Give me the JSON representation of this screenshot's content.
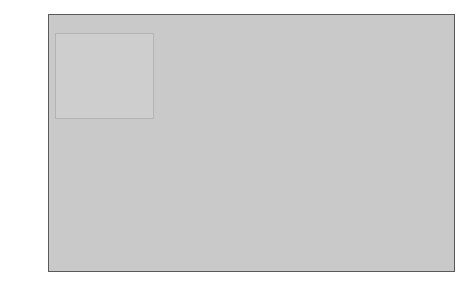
{
  "chart_data": {
    "type": "area",
    "stacked": true,
    "title": "",
    "xlabel": "",
    "ylabel": "",
    "xlim": [
      1950,
      2150
    ],
    "ylim": [
      0,
      12
    ],
    "xticks": [
      1950,
      1990,
      2000,
      2025,
      2050,
      2075,
      2100,
      2125,
      2150
    ],
    "xtick_labels": [
      "1950",
      "1990",
      "2000",
      "2025",
      "2050",
      "2075",
      "2100",
      "2125",
      "2150"
    ],
    "yticks": [
      0,
      1,
      2,
      3,
      4,
      5,
      6,
      7,
      8,
      9,
      10,
      11,
      12
    ],
    "ytick_labels": [
      "0",
      "1",
      "2",
      "3",
      "4",
      "5",
      "6",
      "7",
      "8",
      "9",
      "10",
      "11",
      "12"
    ],
    "grid": true,
    "grid_color": "#f2f2f2",
    "plot_background": "#c9c9c9",
    "legend_position": "upper-left",
    "annotations": [
      {
        "text": "World overall",
        "x": 2050,
        "y": 11.6
      }
    ],
    "x": [
      1950,
      1990,
      2000,
      2025,
      2050,
      2075,
      2100,
      2125,
      2150
    ],
    "series": [
      {
        "name": "Core countries",
        "color": "#d4d4d4",
        "values": [
          0.83,
          1.14,
          1.19,
          1.26,
          1.25,
          1.23,
          1.22,
          1.21,
          1.2
        ]
      },
      {
        "name": "Latin America",
        "color": "#c0c0c0",
        "values": [
          0.17,
          0.44,
          0.52,
          0.7,
          0.78,
          0.8,
          0.8,
          0.8,
          0.8
        ]
      },
      {
        "name": "China",
        "color": "#7d7d7d",
        "values": [
          0.56,
          1.14,
          1.27,
          1.44,
          1.4,
          1.33,
          1.3,
          1.28,
          1.27
        ]
      },
      {
        "name": "India",
        "color": "#a8a8a8",
        "values": [
          0.36,
          0.87,
          1.02,
          1.4,
          1.55,
          1.6,
          1.62,
          1.63,
          1.63
        ]
      },
      {
        "name": "Rest of Asia",
        "color": "#bdbdbd",
        "values": [
          0.47,
          1.21,
          1.44,
          2.0,
          2.26,
          2.4,
          2.45,
          2.48,
          2.5
        ]
      },
      {
        "name": "Africa",
        "color": "#8a8a8a",
        "values": [
          0.22,
          0.63,
          0.81,
          1.47,
          2.18,
          2.9,
          3.31,
          3.5,
          3.6
        ]
      }
    ],
    "totals": [
      2.61,
      5.43,
      6.25,
      8.27,
      9.42,
      10.26,
      10.7,
      10.9,
      11.0
    ]
  },
  "legend": {
    "items": [
      {
        "label": "Africa",
        "color": "#8a8a8a"
      },
      {
        "label": "Rest of Asia",
        "color": "#bdbdbd"
      },
      {
        "label": "India",
        "color": "#a8a8a8"
      },
      {
        "label": "China",
        "color": "#7d7d7d"
      },
      {
        "label": "Latin America",
        "color": "#c0c0c0"
      },
      {
        "label": "Core countries",
        "color": "#d4d4d4"
      }
    ]
  },
  "annotation": {
    "world_overall": "World overall"
  }
}
